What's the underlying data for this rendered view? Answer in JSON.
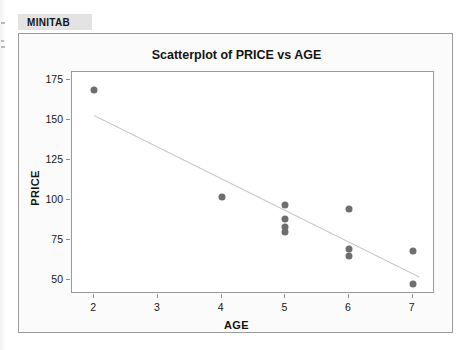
{
  "app": {
    "tab_label": "MINITAB"
  },
  "colors": {
    "marker": "#6e6e6e",
    "regression_line": "#c8c8c8",
    "panel_background": "#fbfbfb",
    "plot_background": "#ffffff",
    "frame_border": "#9a9a9a",
    "tab_background": "#e3e3e3",
    "text": "#161616"
  },
  "chart_data": {
    "type": "scatter",
    "title": "Scatterplot of PRICE vs AGE",
    "xlabel": "AGE",
    "ylabel": "PRICE",
    "xlim": [
      1.65,
      7.35
    ],
    "ylim": [
      41,
      180
    ],
    "xticks": [
      2,
      3,
      4,
      5,
      6,
      7
    ],
    "xtick_labels": [
      "2",
      "3",
      "4",
      "5",
      "6",
      "7"
    ],
    "yticks": [
      50,
      75,
      100,
      125,
      150,
      175
    ],
    "ytick_labels": [
      "50",
      "75",
      "100",
      "125",
      "150",
      "175"
    ],
    "grid": false,
    "legend": false,
    "points": [
      {
        "x": 2,
        "y": 169
      },
      {
        "x": 4,
        "y": 102
      },
      {
        "x": 5,
        "y": 97
      },
      {
        "x": 5,
        "y": 88
      },
      {
        "x": 5,
        "y": 83
      },
      {
        "x": 5,
        "y": 80
      },
      {
        "x": 6,
        "y": 94
      },
      {
        "x": 6,
        "y": 69
      },
      {
        "x": 6,
        "y": 65
      },
      {
        "x": 7,
        "y": 68
      },
      {
        "x": 7,
        "y": 47
      }
    ],
    "fit_line": {
      "name": "regression line",
      "x_start": 2.0,
      "y_start": 153,
      "x_end": 7.1,
      "y_end": 52
    }
  }
}
